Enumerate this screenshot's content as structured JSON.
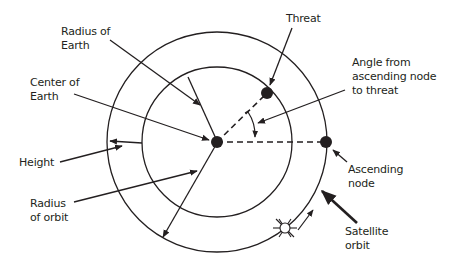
{
  "colors": {
    "line": "#231f20",
    "background": "#ffffff"
  },
  "labels": {
    "radius_of_earth": "Radius of\nEarth",
    "center_of_earth": "Center of\nEarth",
    "height": "Height",
    "radius_of_orbit": "Radius\nof orbit",
    "threat": "Threat",
    "angle": "Angle from\nascending node\nto threat",
    "ascending_node": "Ascending\nnode",
    "satellite_orbit": "Satellite\norbit"
  },
  "geometry": {
    "center": [
      217,
      142
    ],
    "earth_radius": 75,
    "orbit_radius": 110,
    "threat_point": [
      267,
      92
    ],
    "ascending_node_point": [
      326,
      142
    ],
    "satellite_point": [
      285,
      228
    ]
  }
}
